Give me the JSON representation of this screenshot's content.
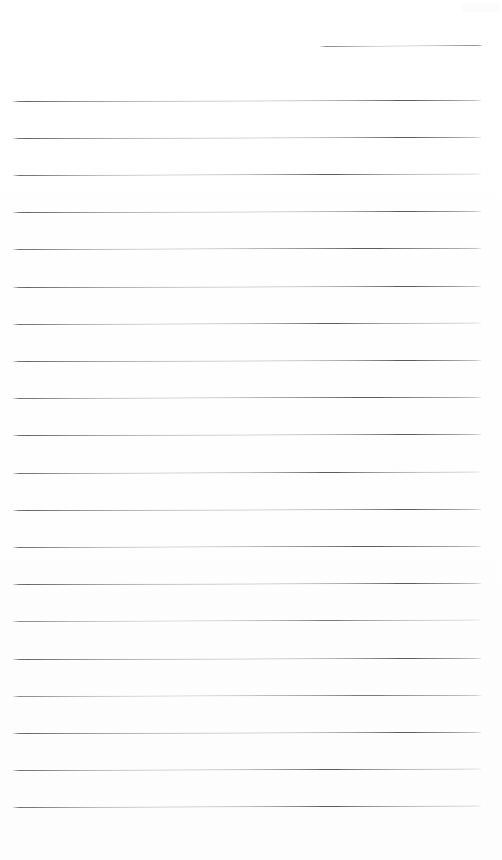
{
  "document": {
    "kind": "scanned-lined-page",
    "title": "Blank ruled notebook page",
    "page_width": 502,
    "page_height": 860,
    "background_color": "#ffffff",
    "paper_tone": "#fefefe",
    "rule_color": "#5c5c5c",
    "rule_color_light": "#7a7a7a",
    "rule_thickness": 1,
    "rule_count": 21,
    "full_rule_count": 20,
    "short_rule_count": 1,
    "rule_spacing": 37.2,
    "margin_left": 13,
    "margin_right": 21,
    "has_text": false,
    "has_handwriting": false,
    "ink_present": "none"
  },
  "artifact": {
    "name": "scanner-smudge",
    "x": 462,
    "y": 2,
    "width": 38,
    "height": 10,
    "color": "#fcfcfc"
  },
  "rules": [
    {
      "id": "rule-0",
      "x": 320,
      "y": 46,
      "width": 162,
      "slant": -1.0,
      "weight": "short"
    },
    {
      "id": "rule-1",
      "x": 13,
      "y": 100.5,
      "width": 468,
      "slant": -1.2,
      "weight": "normal"
    },
    {
      "id": "rule-2",
      "x": 13,
      "y": 137.7,
      "width": 468,
      "slant": -1.2,
      "weight": "normal"
    },
    {
      "id": "rule-3",
      "x": 13,
      "y": 174.9,
      "width": 468,
      "slant": -1.4,
      "weight": "normal"
    },
    {
      "id": "rule-4",
      "x": 13,
      "y": 212.1,
      "width": 468,
      "slant": -1.2,
      "weight": "normal"
    },
    {
      "id": "rule-5",
      "x": 13,
      "y": 249.3,
      "width": 468,
      "slant": -1.3,
      "weight": "normal"
    },
    {
      "id": "rule-6",
      "x": 13,
      "y": 286.5,
      "width": 468,
      "slant": -1.2,
      "weight": "normal"
    },
    {
      "id": "rule-7",
      "x": 13,
      "y": 323.7,
      "width": 468,
      "slant": -1.4,
      "weight": "normal"
    },
    {
      "id": "rule-8",
      "x": 13,
      "y": 360.9,
      "width": 468,
      "slant": -1.2,
      "weight": "normal"
    },
    {
      "id": "rule-9",
      "x": 13,
      "y": 398.1,
      "width": 468,
      "slant": -1.3,
      "weight": "normal"
    },
    {
      "id": "rule-10",
      "x": 13,
      "y": 435.3,
      "width": 468,
      "slant": -1.2,
      "weight": "normal"
    },
    {
      "id": "rule-11",
      "x": 13,
      "y": 472.5,
      "width": 468,
      "slant": -1.4,
      "weight": "normal"
    },
    {
      "id": "rule-12",
      "x": 13,
      "y": 509.7,
      "width": 468,
      "slant": -1.2,
      "weight": "normal"
    },
    {
      "id": "rule-13",
      "x": 13,
      "y": 546.9,
      "width": 468,
      "slant": -1.3,
      "weight": "normal"
    },
    {
      "id": "rule-14",
      "x": 13,
      "y": 584.1,
      "width": 468,
      "slant": -1.2,
      "weight": "normal"
    },
    {
      "id": "rule-15",
      "x": 13,
      "y": 621.3,
      "width": 468,
      "slant": -1.4,
      "weight": "light"
    },
    {
      "id": "rule-16",
      "x": 13,
      "y": 658.5,
      "width": 468,
      "slant": -1.2,
      "weight": "normal"
    },
    {
      "id": "rule-17",
      "x": 13,
      "y": 695.7,
      "width": 468,
      "slant": -1.3,
      "weight": "light"
    },
    {
      "id": "rule-18",
      "x": 13,
      "y": 732.9,
      "width": 468,
      "slant": -1.2,
      "weight": "normal"
    },
    {
      "id": "rule-19",
      "x": 13,
      "y": 770.1,
      "width": 468,
      "slant": -1.4,
      "weight": "normal"
    },
    {
      "id": "rule-20",
      "x": 13,
      "y": 807.3,
      "width": 468,
      "slant": -1.6,
      "weight": "normal"
    }
  ]
}
